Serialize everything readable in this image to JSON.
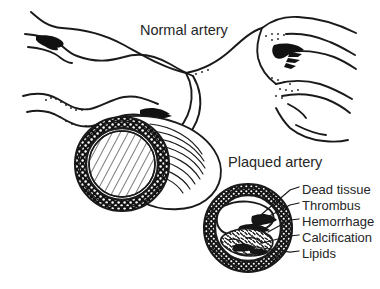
{
  "figure": {
    "title_normal": "Normal artery",
    "title_plaqued": "Plaqued artery",
    "background_color": "#ffffff",
    "ink_color": "#1a1a1a",
    "text_color": "#262626",
    "callouts": [
      {
        "label": "Dead tissue"
      },
      {
        "label": "Thrombus"
      },
      {
        "label": "Hemorrhage"
      },
      {
        "label": "Calcification"
      },
      {
        "label": "Lipids"
      }
    ]
  }
}
